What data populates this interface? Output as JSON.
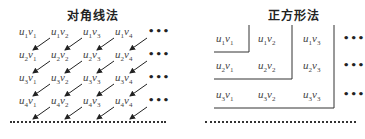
{
  "diagonal": {
    "title": "对角线法",
    "cells": [
      [
        [
          "u",
          "1",
          "v",
          "1"
        ],
        [
          "u",
          "1",
          "v",
          "2"
        ],
        [
          "u",
          "1",
          "v",
          "3"
        ],
        [
          "u",
          "1",
          "v",
          "4"
        ]
      ],
      [
        [
          "u",
          "2",
          "v",
          "1"
        ],
        [
          "u",
          "2",
          "v",
          "2"
        ],
        [
          "u",
          "2",
          "v",
          "3"
        ],
        [
          "u",
          "2",
          "v",
          "4"
        ]
      ],
      [
        [
          "u",
          "3",
          "v",
          "1"
        ],
        [
          "u",
          "3",
          "v",
          "2"
        ],
        [
          "u",
          "3",
          "v",
          "3"
        ],
        [
          "u",
          "3",
          "v",
          "4"
        ]
      ],
      [
        [
          "u",
          "4",
          "v",
          "1"
        ],
        [
          "u",
          "4",
          "v",
          "2"
        ],
        [
          "u",
          "4",
          "v",
          "3"
        ],
        [
          "u",
          "4",
          "v",
          "4"
        ]
      ]
    ],
    "ellipsis": "•••"
  },
  "square": {
    "title": "正方形法",
    "cells": [
      [
        [
          "u",
          "1",
          "v",
          "1"
        ],
        [
          "u",
          "1",
          "v",
          "2"
        ],
        [
          "u",
          "1",
          "v",
          "3"
        ]
      ],
      [
        [
          "u",
          "2",
          "v",
          "1"
        ],
        [
          "u",
          "2",
          "v",
          "2"
        ],
        [
          "u",
          "2",
          "v",
          "3"
        ]
      ],
      [
        [
          "u",
          "3",
          "v",
          "1"
        ],
        [
          "u",
          "3",
          "v",
          "2"
        ],
        [
          "u",
          "3",
          "v",
          "3"
        ]
      ]
    ],
    "ellipsis": "•••"
  }
}
